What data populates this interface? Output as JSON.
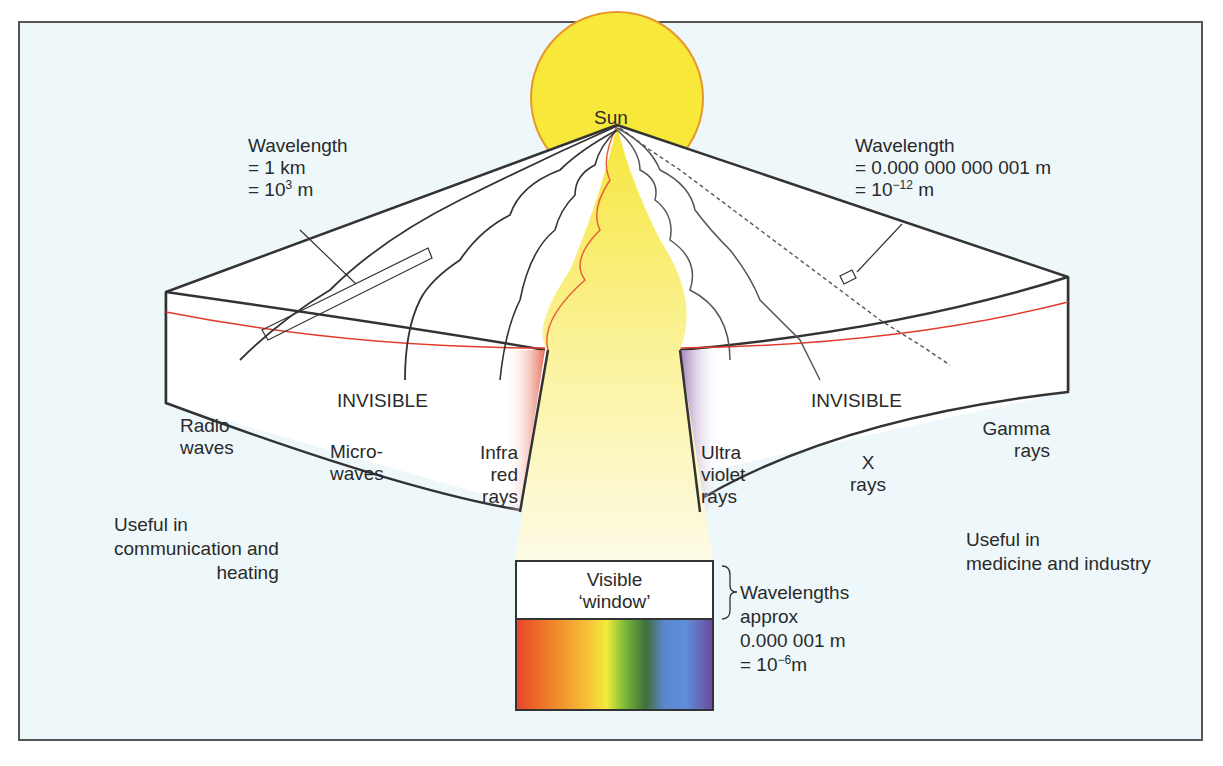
{
  "diagram": {
    "colors": {
      "background": "#eef8fb",
      "sun_fill": "#f7e83a",
      "sun_outline": "#e8962a",
      "band_line": "#e23a2a",
      "infrared_tint": "#e8705a",
      "ultraviolet_tint": "#a47fb8",
      "outline": "#333333"
    },
    "sun": {
      "label": "Sun"
    },
    "left_callout": {
      "line1": "Wavelength",
      "line2": "= 1 km",
      "line3_base": "= 10",
      "line3_exp": "3",
      "line3_unit": " m"
    },
    "right_callout": {
      "line1": "Wavelength",
      "line2": "= 0.000 000 000 001 m",
      "line3_base": "= 10",
      "line3_exp": "−12",
      "line3_unit": " m"
    },
    "bands": {
      "left_heading": "INVISIBLE",
      "right_heading": "INVISIBLE",
      "radio": [
        "Radio",
        "waves"
      ],
      "micro": [
        "Micro-",
        "waves"
      ],
      "infrared": [
        "Infra",
        "red",
        "rays"
      ],
      "ultraviolet": [
        "Ultra",
        "violet",
        "rays"
      ],
      "xray": [
        "X",
        "rays"
      ],
      "gamma": [
        "Gamma",
        "rays"
      ]
    },
    "uses": {
      "left": [
        "Useful in",
        "communication and",
        "heating"
      ],
      "right": [
        "Useful in",
        "medicine and industry"
      ]
    },
    "visible_window": {
      "label": [
        "Visible",
        "‘window’"
      ],
      "spectrum_colors": [
        "#e8452a",
        "#f08a2a",
        "#f7c63a",
        "#f2ec3a",
        "#7dbb3a",
        "#3f7f3a",
        "#5a86cc",
        "#5f8fdc",
        "#6a4a9a"
      ],
      "note": {
        "line1": "Wavelengths",
        "line2": "approx",
        "line3": "0.000 001 m",
        "line4_base": "= 10",
        "line4_exp": "−6",
        "line4_unit": "m"
      }
    }
  }
}
